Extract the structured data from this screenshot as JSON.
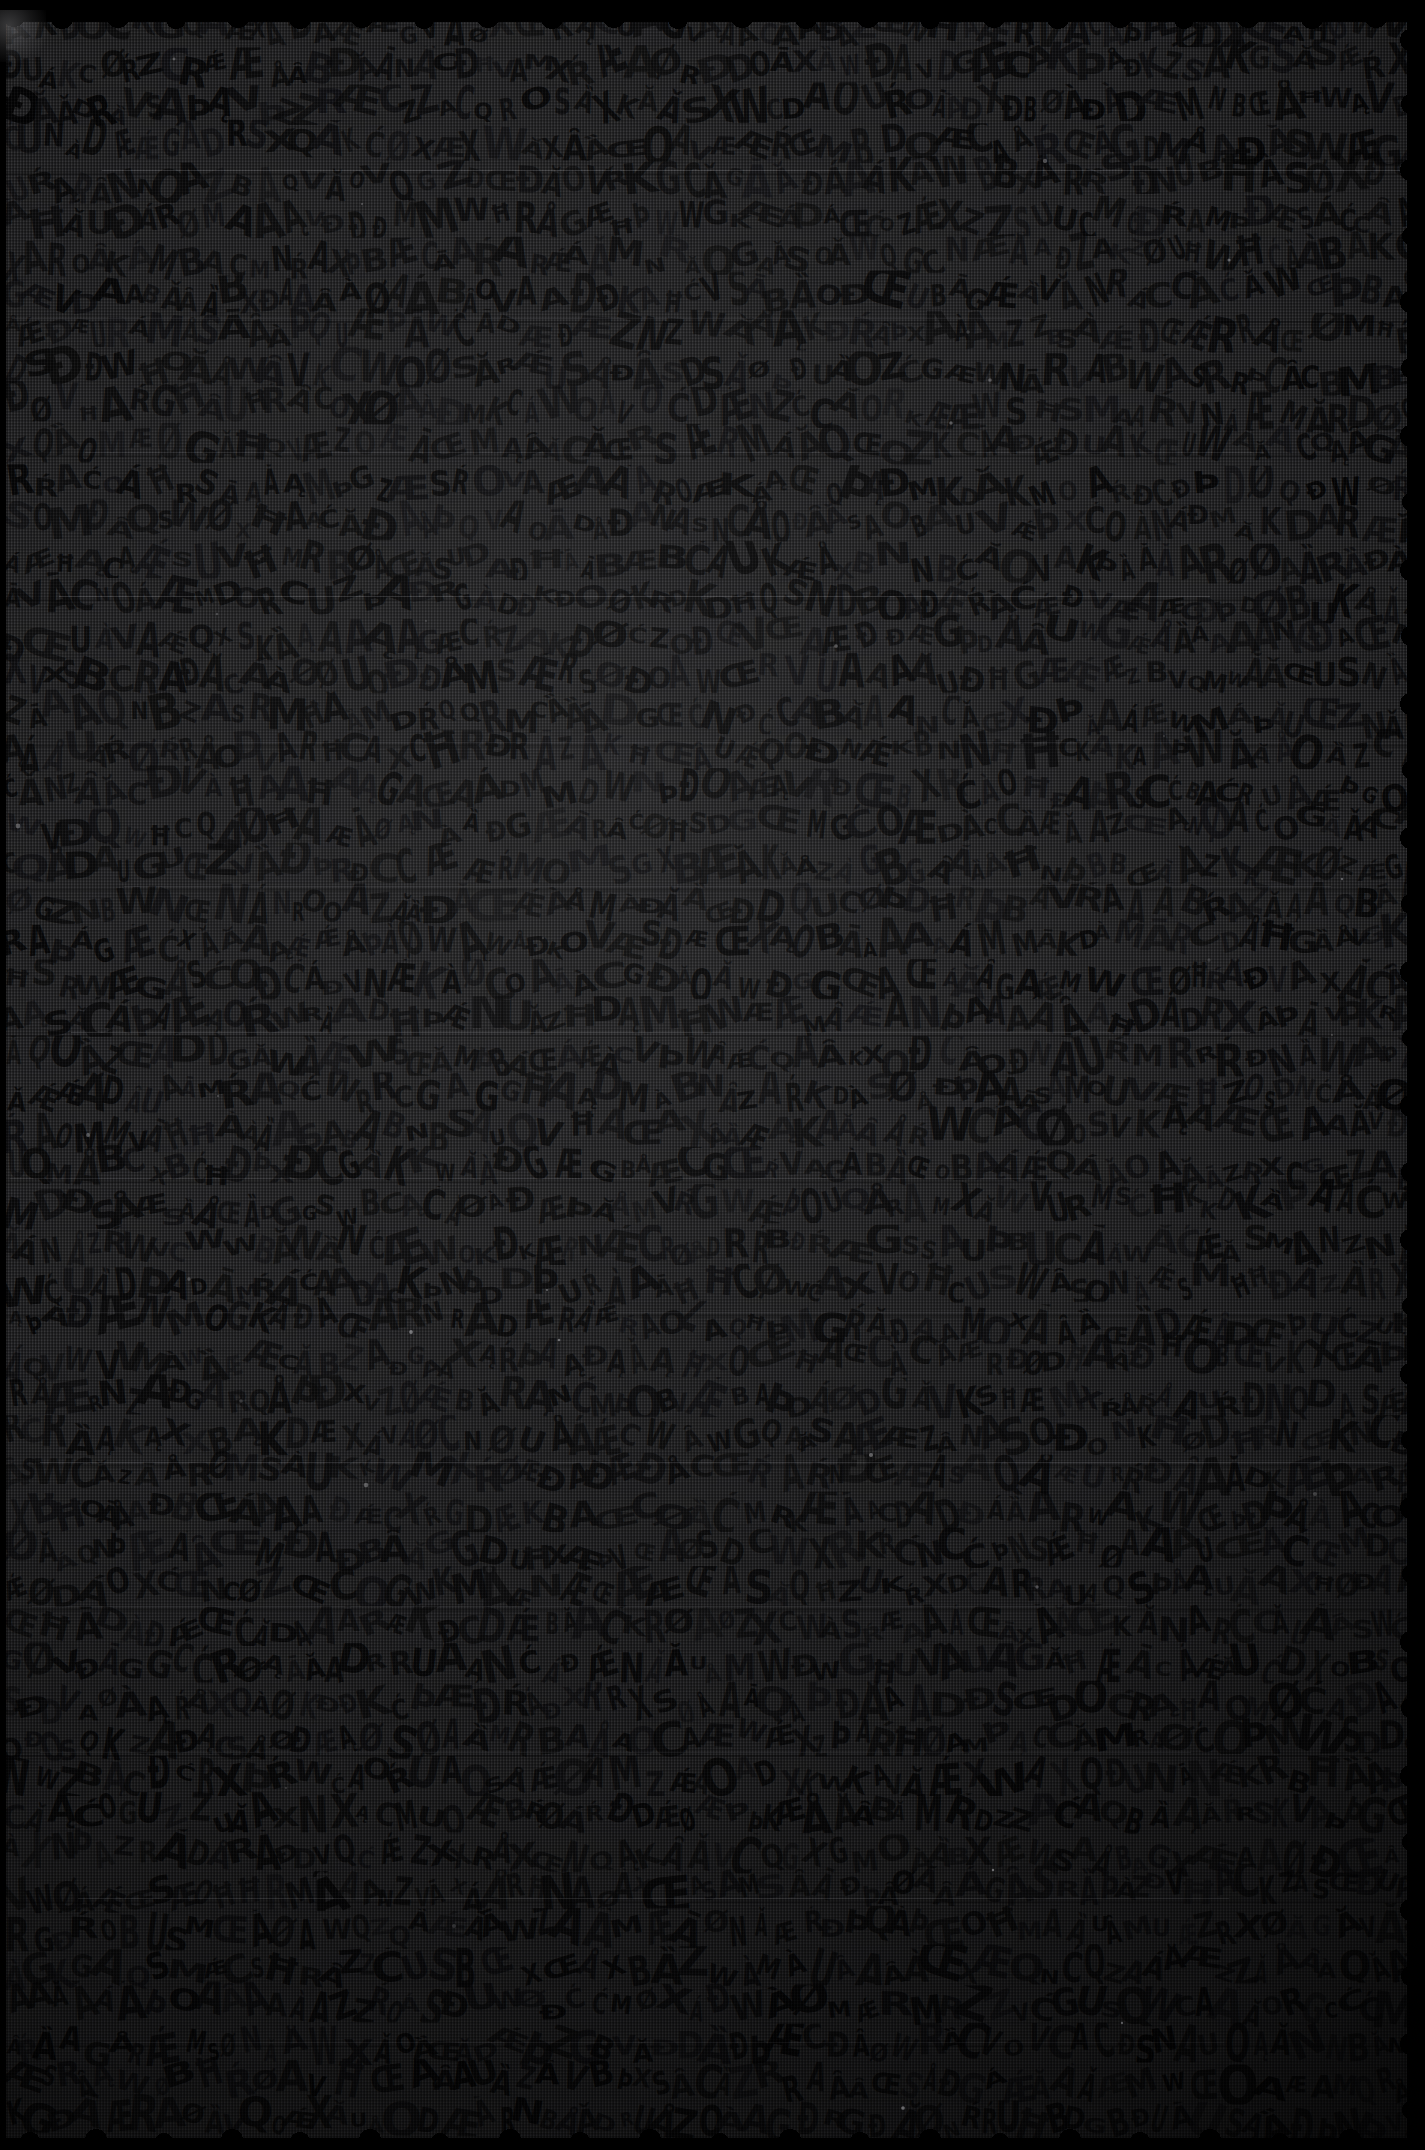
{
  "artifact": {
    "kind": "manuscript-surface-scan",
    "description": "Very dark, low-exposure scan of a densely inscribed manuscript surface",
    "substrate_color": "#2b2b2d",
    "ink_color": "#060607",
    "background_color": "#000000",
    "width_px": 1425,
    "height_px": 2150
  },
  "surface": {
    "left_margin_px": 6,
    "top_margin_px": 22,
    "right_margin_px": 18,
    "bottom_margin_px": 12,
    "edge_profile": "scalloped-irregular",
    "corner_highlight": "top-left"
  },
  "inscription": {
    "layout": "dense horizontal rows of angular loop-and-stroke glyphs",
    "row_count": 56,
    "row_pitch_px": 38,
    "glyph_size_px": 30,
    "legibility": "illegible-at-this-exposure",
    "glyph_repertoire": [
      "Á",
      "Æ",
      "Ą",
      "Ć",
      "Ǽ",
      "Ŕ",
      "À",
      "Ā",
      "Ă",
      "Ǎ",
      "Ȁ",
      "Ȃ",
      "Å",
      "A",
      "M",
      "W",
      "V",
      "N",
      "K",
      "X",
      "R",
      "U",
      "D",
      "B",
      "C",
      "G",
      "O",
      "Q",
      "S",
      "Z",
      "Ð",
      "Þ",
      "Œ",
      "Ø",
      "Đ",
      "Ħ"
    ],
    "sample_rows": [
      "ŔĆÆAKXVŒDQMÅWĄG",
      "ÆXOĐARNUØKCĆVMĂ",
      "AGŔÞWQKXÆBŒNUĆD",
      "MÐVĄXCGÆROĦAKĂW",
      "XĆNQÅDŒUMAØGVŔK"
    ]
  },
  "seams": {
    "description": "faint horizontal ruling / band separation lines",
    "positions_px": [
      170,
      318,
      452,
      596,
      742,
      886,
      1032,
      1178,
      1312,
      1462,
      1606,
      1752,
      1898,
      2042
    ],
    "line_color": "#bebec3"
  },
  "lighting": {
    "description": "uneven illumination, brighter toward upper-left-of-center, darkening toward lower-right and all edges",
    "hotspot": "44% 36%",
    "vignette": true
  }
}
